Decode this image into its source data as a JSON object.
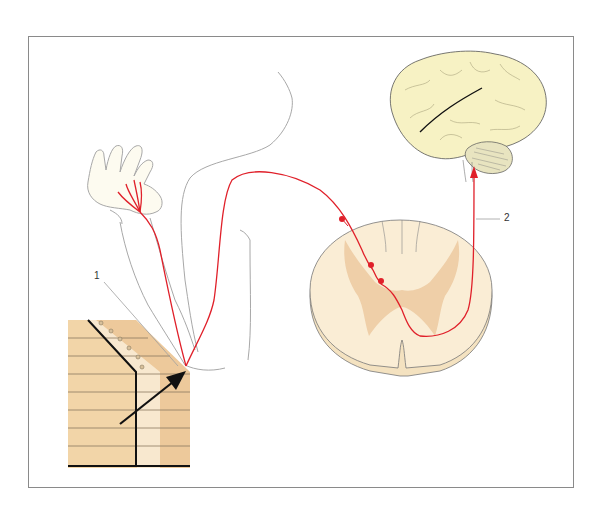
{
  "figure": {
    "type": "anatomical-illustration",
    "labels": [
      {
        "id": "1",
        "text": "1",
        "points_to": "sensory receptor at elbow contact point"
      },
      {
        "id": "2",
        "text": "2",
        "points_to": "ascending pathway to brain"
      }
    ],
    "colors": {
      "nerve": "#e0202a",
      "brain": "#f7f2c4",
      "cerebellum": "#e8e4c0",
      "spinal_white": "#f9ecd2",
      "spinal_grey": "#ecc9a0",
      "block": "#f2d5a8",
      "outline": "#9a9a9a",
      "arrow": "#111111",
      "frame": "#8a8a8a"
    }
  }
}
